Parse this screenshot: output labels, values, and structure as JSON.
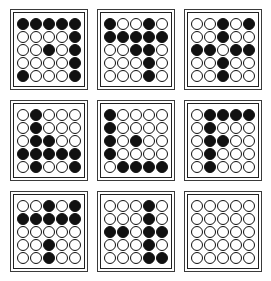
{
  "figure": {
    "type": "dot-matrix-panel-grid",
    "panel_rows": 3,
    "panel_cols": 3,
    "matrix_rows": 5,
    "matrix_cols": 5,
    "filled_color": "#111111",
    "empty_color": "#ffffff",
    "outline_color": "#111111",
    "panel_border_color": "#3a3a3a",
    "background_color": "#ffffff",
    "legend": {
      "filled_symbol": "●",
      "empty_symbol": "○",
      "filled_value": 1,
      "empty_value": 0
    }
  },
  "panels": [
    {
      "id": "panel-1",
      "position": "top-left",
      "filled_count": 11,
      "matrix": [
        [
          1,
          1,
          1,
          1,
          1
        ],
        [
          0,
          0,
          0,
          0,
          1
        ],
        [
          0,
          0,
          1,
          0,
          1
        ],
        [
          0,
          0,
          0,
          0,
          1
        ],
        [
          1,
          0,
          0,
          0,
          1
        ]
      ]
    },
    {
      "id": "panel-2",
      "position": "top-center",
      "filled_count": 11,
      "matrix": [
        [
          1,
          0,
          0,
          1,
          0
        ],
        [
          1,
          1,
          1,
          1,
          1
        ],
        [
          0,
          0,
          1,
          1,
          0
        ],
        [
          0,
          0,
          0,
          1,
          0
        ],
        [
          0,
          0,
          0,
          1,
          0
        ]
      ]
    },
    {
      "id": "panel-3",
      "position": "top-right",
      "filled_count": 10,
      "matrix": [
        [
          0,
          0,
          1,
          0,
          1
        ],
        [
          0,
          0,
          1,
          0,
          0
        ],
        [
          1,
          1,
          0,
          1,
          1
        ],
        [
          0,
          0,
          1,
          0,
          0
        ],
        [
          0,
          0,
          1,
          0,
          0
        ]
      ]
    },
    {
      "id": "panel-4",
      "position": "middle-left",
      "filled_count": 11,
      "matrix": [
        [
          0,
          1,
          0,
          0,
          0
        ],
        [
          0,
          1,
          0,
          0,
          0
        ],
        [
          0,
          1,
          1,
          0,
          0
        ],
        [
          1,
          1,
          1,
          1,
          1
        ],
        [
          0,
          1,
          0,
          0,
          1
        ]
      ]
    },
    {
      "id": "panel-5",
      "position": "middle-center",
      "filled_count": 9,
      "matrix": [
        [
          1,
          0,
          0,
          0,
          0
        ],
        [
          1,
          0,
          0,
          0,
          0
        ],
        [
          1,
          0,
          1,
          0,
          0
        ],
        [
          1,
          0,
          0,
          0,
          0
        ],
        [
          0,
          1,
          1,
          1,
          1
        ]
      ]
    },
    {
      "id": "panel-6",
      "position": "middle-right",
      "filled_count": 9,
      "matrix": [
        [
          0,
          1,
          1,
          1,
          1
        ],
        [
          0,
          1,
          0,
          0,
          0
        ],
        [
          0,
          1,
          1,
          0,
          0
        ],
        [
          0,
          1,
          0,
          0,
          0
        ],
        [
          0,
          1,
          0,
          0,
          0
        ]
      ]
    },
    {
      "id": "panel-7",
      "position": "bottom-left",
      "filled_count": 9,
      "matrix": [
        [
          0,
          0,
          1,
          0,
          1
        ],
        [
          1,
          1,
          1,
          1,
          1
        ],
        [
          0,
          0,
          0,
          0,
          0
        ],
        [
          0,
          0,
          1,
          0,
          0
        ],
        [
          0,
          0,
          1,
          0,
          0
        ]
      ]
    },
    {
      "id": "panel-8",
      "position": "bottom-center",
      "filled_count": 10,
      "matrix": [
        [
          0,
          0,
          0,
          1,
          0
        ],
        [
          0,
          0,
          0,
          1,
          0
        ],
        [
          1,
          1,
          0,
          1,
          1
        ],
        [
          0,
          0,
          0,
          1,
          0
        ],
        [
          0,
          0,
          0,
          1,
          1
        ]
      ]
    },
    {
      "id": "panel-9",
      "position": "bottom-right",
      "filled_count": 0,
      "matrix": [
        [
          0,
          0,
          0,
          0,
          0
        ],
        [
          0,
          0,
          0,
          0,
          0
        ],
        [
          0,
          0,
          0,
          0,
          0
        ],
        [
          0,
          0,
          0,
          0,
          0
        ],
        [
          0,
          0,
          0,
          0,
          0
        ]
      ]
    }
  ]
}
